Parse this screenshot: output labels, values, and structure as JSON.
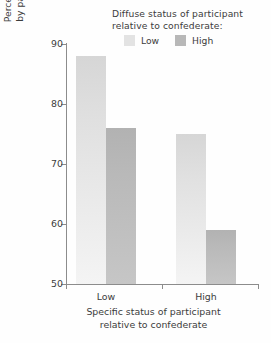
{
  "chart_data": {
    "type": "bar",
    "title": "",
    "categories": [
      "Low",
      "High"
    ],
    "series": [
      {
        "name": "Low",
        "values": [
          88,
          75
        ]
      },
      {
        "name": "High",
        "values": [
          76,
          59
        ]
      }
    ],
    "xlabel_lines": [
      "Specific status of participant",
      "relative to confederate"
    ],
    "ylabel_lines": [
      "Percentage yielding responses",
      "by participants to confederate"
    ],
    "yticks": [
      50,
      60,
      70,
      80,
      90
    ],
    "ylim": [
      50,
      90
    ],
    "grid": false,
    "legend_title_lines": [
      "Diffuse status of participant",
      "relative to confederate:"
    ],
    "legend_position": "top-right",
    "colors": {
      "series_low": "#e3e3e3",
      "series_high": "#b8b8b8",
      "axis": "#8c8c8c",
      "text": "#3c3c3c",
      "background": "#fefefe"
    }
  },
  "legend": {
    "title_line1": "Diffuse status of participant",
    "title_line2": "relative to confederate:",
    "keys": [
      {
        "label": "Low"
      },
      {
        "label": "High"
      }
    ]
  },
  "axes": {
    "y": {
      "ticks": [
        "50",
        "60",
        "70",
        "80",
        "90"
      ],
      "title_line1": "Percentage yielding responses",
      "title_line2": "by participants to confederate"
    },
    "x": {
      "ticks": [
        "Low",
        "High"
      ],
      "title_line1": "Specific status of participant",
      "title_line2": "relative to confederate"
    }
  }
}
